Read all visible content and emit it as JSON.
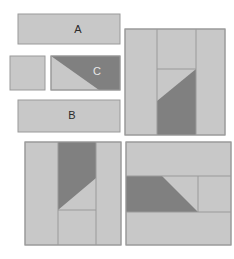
{
  "figure": {
    "width": 234,
    "height": 259,
    "background": "#ffffff"
  },
  "colors": {
    "light_gray": "#c8c8c8",
    "dark_gray": "#808080",
    "stroke": "#9a9a9a",
    "label_dark": "#2b2b2b",
    "label_light": "#e8e8e8",
    "page_background": "#ffffff"
  },
  "legend_tiles": [
    {
      "id": "tile-a",
      "label": "A",
      "shape": "rectangle",
      "fill": "light_gray",
      "label_color": "label_dark",
      "x": 18,
      "y": 14,
      "width": 102,
      "height": 30,
      "label_x": 78,
      "label_y": 30
    },
    {
      "id": "tile-square",
      "label": "",
      "shape": "square",
      "fill": "light_gray",
      "x": 10,
      "y": 56,
      "width": 35,
      "height": 34
    },
    {
      "id": "tile-c",
      "label": "C",
      "shape": "rectangle-with-diagonal",
      "fill": "dark_gray",
      "secondary_fill": "light_gray",
      "label_color": "label_light",
      "x": 51,
      "y": 56,
      "width": 69,
      "height": 34,
      "label_x": 97,
      "label_y": 72,
      "diagonal": "top-left-to-bottom-right, dark above"
    },
    {
      "id": "tile-b",
      "label": "B",
      "shape": "rectangle",
      "fill": "light_gray",
      "label_color": "label_dark",
      "x": 18,
      "y": 100,
      "width": 102,
      "height": 32,
      "label_x": 72,
      "label_y": 116
    }
  ],
  "arrangement_panels": [
    {
      "id": "panel-top-right",
      "name": "arrangement-panel-1",
      "x": 125,
      "y": 29,
      "width": 100,
      "height": 106,
      "orientation": "vertical-strips",
      "divider_x": [
        157,
        196
      ],
      "c_tile": {
        "x": 157,
        "y": 69,
        "width": 39,
        "height": 66,
        "dark_side": "right",
        "diagonal": "bottom-left-to-top-right"
      }
    },
    {
      "id": "panel-bottom-left",
      "name": "arrangement-panel-2",
      "x": 25,
      "y": 142,
      "width": 96,
      "height": 103,
      "orientation": "vertical-strips",
      "divider_x": [
        58,
        96
      ],
      "divider_y": [
        210
      ],
      "c_tile": {
        "x": 58,
        "y": 142,
        "width": 38,
        "height": 68,
        "dark_side": "left",
        "diagonal": "bottom-left-to-top-right"
      }
    },
    {
      "id": "panel-bottom-right",
      "name": "arrangement-panel-3",
      "x": 126,
      "y": 142,
      "width": 105,
      "height": 103,
      "orientation": "horizontal-bands",
      "divider_y": [
        176,
        212
      ],
      "divider_x": [
        198
      ],
      "c_tile": {
        "x": 126,
        "y": 176,
        "width": 72,
        "height": 36,
        "dark_side": "lower-left",
        "diagonal": "top-right-to-bottom-left"
      }
    }
  ]
}
